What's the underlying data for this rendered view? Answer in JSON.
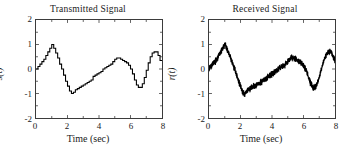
{
  "figure": {
    "background": "#ffffff",
    "axis_color": "#3b3b3b",
    "trace_color": "#000000"
  },
  "panels": [
    {
      "key": "transmitted",
      "title": "Transmitted Signal",
      "xlabel": "Time (sec)",
      "ylabel": "s(t)",
      "ytick_labels": [
        "2",
        "1",
        "0",
        "-1",
        "-2"
      ],
      "xtick_labels": [
        "0",
        "2",
        "4",
        "6",
        "8"
      ]
    },
    {
      "key": "received",
      "title": "Received Signal",
      "xlabel": "Time (sec)",
      "ylabel": "r(t)",
      "ytick_labels": [
        "2",
        "1",
        "0",
        "-1",
        "-2"
      ],
      "xtick_labels": [
        "0",
        "2",
        "4",
        "6",
        "8"
      ]
    }
  ],
  "chart_data": [
    {
      "type": "line",
      "title": "Transmitted Signal",
      "xlabel": "Time (sec)",
      "ylabel": "s(t)",
      "xlim": [
        0,
        8
      ],
      "ylim": [
        -2,
        2
      ],
      "xticks": [
        0,
        2,
        4,
        6,
        8
      ],
      "yticks": [
        -2,
        -1,
        0,
        1,
        2
      ],
      "xminor_ticks": [
        1,
        3,
        5,
        7
      ],
      "yminor_ticks": [
        -1.5,
        -0.5,
        0.5,
        1.5
      ],
      "grid": false,
      "legend": null,
      "style": "quantized staircase (sample-and-hold), step width 0.125 sec",
      "series": [
        {
          "name": "s(t)",
          "x": [
            0.0,
            0.125,
            0.25,
            0.375,
            0.5,
            0.625,
            0.75,
            0.875,
            1.0,
            1.125,
            1.25,
            1.375,
            1.5,
            1.625,
            1.75,
            1.875,
            2.0,
            2.125,
            2.25,
            2.375,
            2.5,
            2.625,
            2.75,
            2.875,
            3.0,
            3.125,
            3.25,
            3.375,
            3.5,
            3.625,
            3.75,
            3.875,
            4.0,
            4.125,
            4.25,
            4.375,
            4.5,
            4.625,
            4.75,
            4.875,
            5.0,
            5.125,
            5.25,
            5.375,
            5.5,
            5.625,
            5.75,
            5.875,
            6.0,
            6.125,
            6.25,
            6.375,
            6.5,
            6.625,
            6.75,
            6.875,
            7.0,
            7.125,
            7.25,
            7.375,
            7.5,
            7.625,
            7.75,
            7.875,
            8.0
          ],
          "y": [
            0.0,
            0.1,
            0.2,
            0.3,
            0.4,
            0.55,
            0.7,
            0.85,
            1.0,
            0.85,
            0.65,
            0.45,
            0.2,
            0.0,
            -0.25,
            -0.5,
            -0.7,
            -0.9,
            -1.0,
            -0.95,
            -0.85,
            -0.8,
            -0.75,
            -0.7,
            -0.65,
            -0.6,
            -0.55,
            -0.5,
            -0.45,
            -0.4,
            -0.3,
            -0.25,
            -0.2,
            -0.15,
            -0.1,
            0.0,
            0.05,
            0.1,
            0.15,
            0.2,
            0.3,
            0.4,
            0.45,
            0.45,
            0.4,
            0.35,
            0.3,
            0.25,
            0.15,
            0.0,
            -0.2,
            -0.45,
            -0.65,
            -0.75,
            -0.75,
            -0.6,
            -0.35,
            -0.05,
            0.25,
            0.5,
            0.65,
            0.7,
            0.7,
            0.55,
            0.35
          ]
        }
      ]
    },
    {
      "type": "line",
      "title": "Received Signal",
      "xlabel": "Time (sec)",
      "ylabel": "r(t)",
      "xlim": [
        0,
        8
      ],
      "ylim": [
        -2,
        2
      ],
      "xticks": [
        0,
        2,
        4,
        6,
        8
      ],
      "yticks": [
        -2,
        -1,
        0,
        1,
        2
      ],
      "xminor_ticks": [
        1,
        3,
        5,
        7
      ],
      "yminor_ticks": [
        -1.5,
        -0.5,
        0.5,
        1.5
      ],
      "grid": false,
      "legend": null,
      "style": "same underlying waveform with additive high-frequency noise (band approx +/- 0.09)",
      "series": [
        {
          "name": "r(t)",
          "x": [
            0.0,
            0.125,
            0.25,
            0.375,
            0.5,
            0.625,
            0.75,
            0.875,
            1.0,
            1.125,
            1.25,
            1.375,
            1.5,
            1.625,
            1.75,
            1.875,
            2.0,
            2.125,
            2.25,
            2.375,
            2.5,
            2.625,
            2.75,
            2.875,
            3.0,
            3.125,
            3.25,
            3.375,
            3.5,
            3.625,
            3.75,
            3.875,
            4.0,
            4.125,
            4.25,
            4.375,
            4.5,
            4.625,
            4.75,
            4.875,
            5.0,
            5.125,
            5.25,
            5.375,
            5.5,
            5.625,
            5.75,
            5.875,
            6.0,
            6.125,
            6.25,
            6.375,
            6.5,
            6.625,
            6.75,
            6.875,
            7.0,
            7.125,
            7.25,
            7.375,
            7.5,
            7.625,
            7.75,
            7.875,
            8.0
          ],
          "y": [
            0.0,
            0.1,
            0.2,
            0.3,
            0.4,
            0.55,
            0.7,
            0.85,
            1.0,
            0.85,
            0.65,
            0.45,
            0.2,
            0.0,
            -0.25,
            -0.5,
            -0.7,
            -0.9,
            -1.0,
            -0.95,
            -0.85,
            -0.8,
            -0.75,
            -0.7,
            -0.65,
            -0.6,
            -0.55,
            -0.5,
            -0.45,
            -0.4,
            -0.3,
            -0.25,
            -0.2,
            -0.15,
            -0.1,
            0.0,
            0.05,
            0.1,
            0.15,
            0.2,
            0.3,
            0.4,
            0.45,
            0.45,
            0.4,
            0.35,
            0.3,
            0.25,
            0.15,
            0.0,
            -0.2,
            -0.45,
            -0.65,
            -0.75,
            -0.75,
            -0.6,
            -0.35,
            -0.05,
            0.25,
            0.5,
            0.65,
            0.7,
            0.7,
            0.55,
            0.35
          ],
          "noise_amplitude": 0.09
        }
      ]
    }
  ]
}
